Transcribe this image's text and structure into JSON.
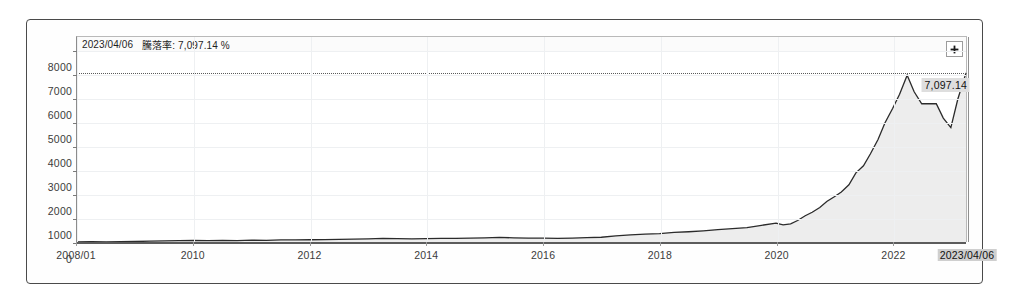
{
  "chart_data": {
    "type": "area",
    "title": "",
    "xlabel": "",
    "ylabel": "",
    "ylim": [
      0,
      8600
    ],
    "xlim": [
      "2008-01",
      "2023-04-06"
    ],
    "grid": true,
    "legend_position": "none",
    "y_ticks": [
      "8000",
      "7000",
      "6000",
      "5000",
      "4000",
      "3000",
      "2000",
      "1000",
      "0"
    ],
    "y_tick_values": [
      8000,
      7000,
      6000,
      5000,
      4000,
      3000,
      2000,
      1000,
      0
    ],
    "x_ticks": [
      "2008/01",
      "2010",
      "2012",
      "2014",
      "2016",
      "2018",
      "2020",
      "2022"
    ],
    "x_tick_values": [
      2008.0,
      2010.0,
      2012.0,
      2014.0,
      2016.0,
      2018.0,
      2020.0,
      2022.0
    ],
    "series": [
      {
        "name": "騰落率",
        "line_color": "#2b2b2b",
        "fill_color": "#ededed",
        "x": [
          2008.0,
          2008.25,
          2008.5,
          2008.75,
          2009.0,
          2009.25,
          2009.5,
          2009.75,
          2010.0,
          2010.25,
          2010.5,
          2010.75,
          2011.0,
          2011.25,
          2011.5,
          2011.75,
          2012.0,
          2012.25,
          2012.5,
          2012.75,
          2013.0,
          2013.25,
          2013.5,
          2013.75,
          2014.0,
          2014.25,
          2014.5,
          2014.75,
          2015.0,
          2015.25,
          2015.5,
          2015.75,
          2016.0,
          2016.25,
          2016.5,
          2016.75,
          2017.0,
          2017.25,
          2017.5,
          2017.75,
          2018.0,
          2018.25,
          2018.5,
          2018.75,
          2019.0,
          2019.25,
          2019.5,
          2019.75,
          2020.0,
          2020.12,
          2020.25,
          2020.37,
          2020.5,
          2020.62,
          2020.75,
          2020.87,
          2021.0,
          2021.12,
          2021.25,
          2021.37,
          2021.5,
          2021.62,
          2021.75,
          2021.87,
          2022.0,
          2022.12,
          2022.25,
          2022.37,
          2022.5,
          2022.62,
          2022.75,
          2022.87,
          2023.0,
          2023.12,
          2023.26
        ],
        "values": [
          0,
          10,
          5,
          15,
          20,
          35,
          45,
          60,
          70,
          55,
          65,
          60,
          75,
          70,
          85,
          90,
          95,
          100,
          110,
          120,
          130,
          150,
          140,
          135,
          145,
          155,
          150,
          160,
          170,
          190,
          175,
          165,
          160,
          150,
          165,
          180,
          200,
          260,
          300,
          330,
          350,
          400,
          430,
          470,
          520,
          560,
          600,
          700,
          790,
          720,
          760,
          900,
          1100,
          1250,
          1450,
          1700,
          1900,
          2100,
          2400,
          2900,
          3200,
          3700,
          4300,
          5000,
          5600,
          6200,
          7000,
          6300,
          5800,
          5800,
          5800,
          5200,
          4800,
          6000,
          7097
        ]
      }
    ],
    "reference_line": {
      "value": 7097.14,
      "style": "dotted",
      "color": "#5a5a5a"
    },
    "highlight": {
      "date": "2023/04/06",
      "value_label": "7,097.14",
      "value": 7097.14
    },
    "annotations": [
      {
        "name": "tooltip",
        "date": "2023/04/06",
        "metric_label": "騰落率:",
        "value": "7,097.14 %"
      }
    ]
  },
  "tooltip": {
    "date": "2023/04/06",
    "metric": "騰落率: 7,097.14 %"
  },
  "callouts": {
    "value_label": "7,097.14",
    "date_label": "2023/04/06"
  },
  "controls": {
    "expand_title": "+"
  }
}
